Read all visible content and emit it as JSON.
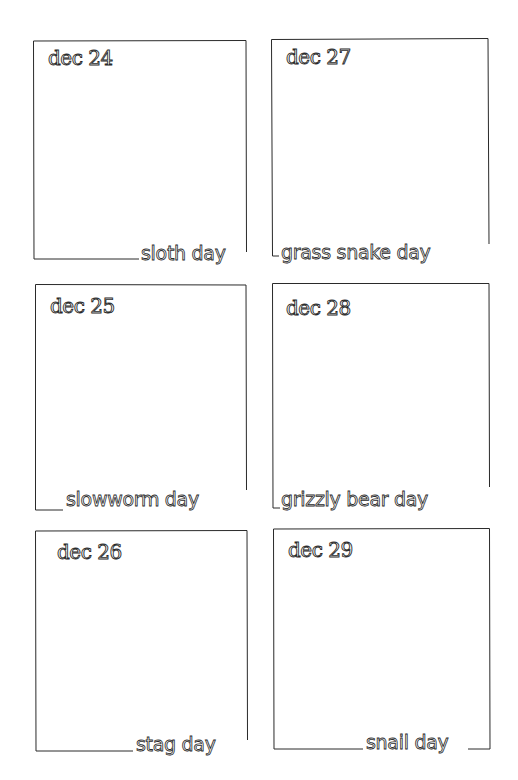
{
  "document": {
    "type": "hand-drawn calendar journal page",
    "ink_color": "#2a2a2a",
    "paper_color": "#ffffff"
  },
  "panels": [
    {
      "date": "dec 24",
      "caption": "sloth day"
    },
    {
      "date": "dec 27",
      "caption": "grass snake day"
    },
    {
      "date": "dec 25",
      "caption": "slowworm day"
    },
    {
      "date": "dec 28",
      "caption": "grizzly bear day"
    },
    {
      "date": "dec 26",
      "caption": "stag day"
    },
    {
      "date": "dec 29",
      "caption": "snail day"
    }
  ]
}
